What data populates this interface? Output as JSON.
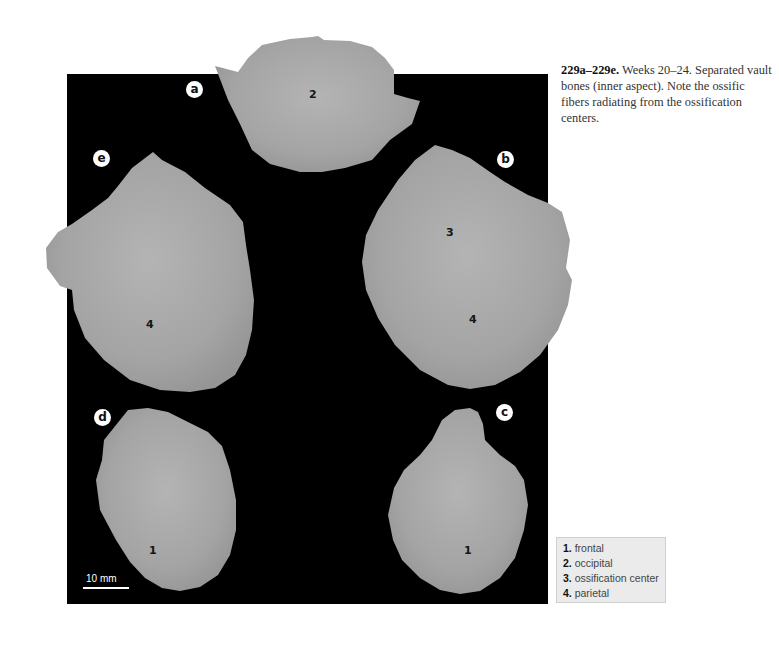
{
  "caption": {
    "figure_id": "229a–229e.",
    "text": " Weeks 20–24. Separated vault bones (inner aspect). Note the ossific fibers radiating from the ossification centers."
  },
  "panel_labels": [
    "a",
    "b",
    "c",
    "d",
    "e"
  ],
  "bones": {
    "a": {
      "label": "a",
      "number": "2"
    },
    "b": {
      "label": "b",
      "numbers": [
        "3",
        "4"
      ]
    },
    "c": {
      "label": "c",
      "number": "1"
    },
    "d": {
      "label": "d",
      "number": "1"
    },
    "e": {
      "label": "e",
      "number": "4"
    }
  },
  "scale_bar": {
    "label": "10 mm"
  },
  "legend": {
    "items": [
      {
        "num": "1.",
        "label": "frontal"
      },
      {
        "num": "2.",
        "label": "occipital"
      },
      {
        "num": "3.",
        "label": "ossification center"
      },
      {
        "num": "4.",
        "label": "parietal"
      }
    ]
  },
  "colors": {
    "background_panel": "#000000",
    "bone": "#a9a9a9",
    "legend_bg": "#ebebeb"
  }
}
